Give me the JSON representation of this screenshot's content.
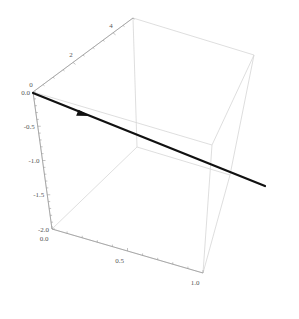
{
  "chart_data": {
    "type": "line3d",
    "title": "",
    "axes": {
      "x": {
        "label": "",
        "range": [
          0.0,
          1.0
        ],
        "ticks": [
          0.0,
          0.5,
          1.0
        ],
        "tick_labels": [
          "0.0",
          "0.5",
          "1.0"
        ]
      },
      "y": {
        "label": "",
        "range": [
          0,
          5
        ],
        "ticks": [
          0,
          2,
          4
        ],
        "tick_labels": [
          "0",
          "2",
          "4"
        ]
      },
      "z": {
        "label": "",
        "range": [
          -2.0,
          0.0
        ],
        "ticks": [
          0.0,
          -0.5,
          -1.0,
          -1.5,
          -2.0
        ],
        "tick_labels": [
          "0.0",
          "-0.5",
          "-1.0",
          "-1.5",
          "-2.0"
        ]
      }
    },
    "series": [
      {
        "name": "arrow",
        "kind": "arrow",
        "color": "#111111",
        "points": [
          {
            "x": 0.0,
            "y": 0.0,
            "z": 0.0
          },
          {
            "x": 1.0,
            "y": 1.5,
            "z": -0.3
          }
        ],
        "arrowhead_at": 0.22
      }
    ],
    "box": true,
    "grid": false,
    "legend": "none"
  },
  "colors": {
    "background": "#ffffff",
    "box": "#d6d6d6",
    "axis": "#9a9a9a",
    "arrow": "#111111",
    "tick_text": "#555555"
  }
}
